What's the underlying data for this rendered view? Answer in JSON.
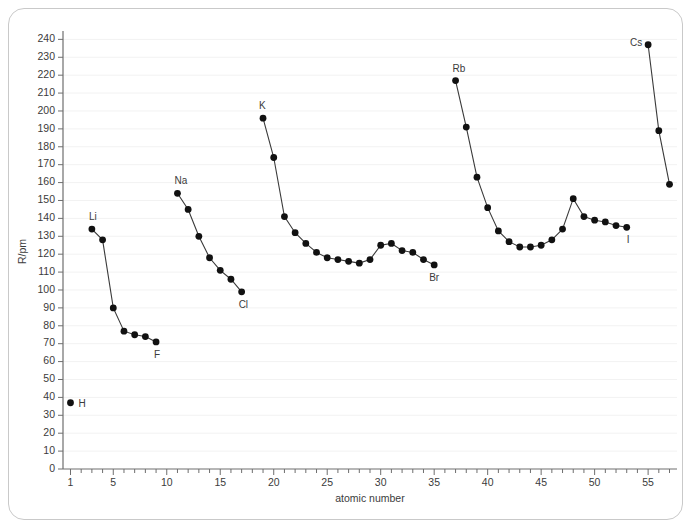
{
  "chart_data": {
    "type": "line",
    "title": "",
    "xlabel": "atomic number",
    "ylabel": "R/pm",
    "xlim": [
      0.3,
      57.7
    ],
    "ylim": [
      0,
      243
    ],
    "grid": true,
    "legend": "none",
    "y_ticks": [
      0,
      10,
      20,
      30,
      40,
      50,
      60,
      70,
      80,
      90,
      100,
      110,
      120,
      130,
      140,
      150,
      160,
      170,
      180,
      190,
      200,
      210,
      220,
      230,
      240
    ],
    "x_ticks_major": [
      1,
      5,
      10,
      15,
      20,
      25,
      30,
      35,
      40,
      45,
      50,
      55
    ],
    "x_tick_step_minor": 1,
    "x_tick_min": 1,
    "x_tick_max": 57,
    "series": [
      {
        "name": "period-1",
        "x": [
          1
        ],
        "values": [
          37
        ]
      },
      {
        "name": "period-2",
        "x": [
          3,
          4,
          5,
          6,
          7,
          8,
          9
        ],
        "values": [
          134,
          128,
          90,
          77,
          75,
          74,
          71
        ]
      },
      {
        "name": "period-3",
        "x": [
          11,
          12,
          13,
          14,
          15,
          16,
          17
        ],
        "values": [
          154,
          145,
          130,
          118,
          111,
          106,
          99
        ]
      },
      {
        "name": "period-4",
        "x": [
          19,
          20,
          21,
          22,
          23,
          24,
          25,
          26,
          27,
          28,
          29,
          30,
          31,
          32,
          33,
          34,
          35
        ],
        "values": [
          196,
          174,
          141,
          132,
          126,
          121,
          118,
          117,
          116,
          115,
          117,
          125,
          126,
          122,
          121,
          117,
          114
        ]
      },
      {
        "name": "period-5",
        "x": [
          37,
          38,
          39,
          40,
          41,
          42,
          43,
          44,
          45,
          46,
          47,
          48,
          49,
          50,
          51,
          52,
          53
        ],
        "values": [
          217,
          191,
          163,
          146,
          133,
          127,
          124,
          124,
          125,
          128,
          134,
          151,
          141,
          139,
          138,
          136,
          135
        ]
      },
      {
        "name": "period-6",
        "x": [
          55,
          56,
          57
        ],
        "values": [
          237,
          189,
          159
        ]
      }
    ],
    "point_labels": [
      {
        "text": "H",
        "x": 1,
        "y": 37,
        "dx": 8,
        "dy": 4
      },
      {
        "text": "Li",
        "x": 3,
        "y": 134,
        "dx": -3,
        "dy": -9
      },
      {
        "text": "F",
        "x": 9,
        "y": 71,
        "dx": -2,
        "dy": 16
      },
      {
        "text": "Na",
        "x": 11,
        "y": 154,
        "dx": -3,
        "dy": -9
      },
      {
        "text": "Cl",
        "x": 17,
        "y": 99,
        "dx": -3,
        "dy": 16
      },
      {
        "text": "K",
        "x": 19,
        "y": 196,
        "dx": -4,
        "dy": -9
      },
      {
        "text": "Br",
        "x": 35,
        "y": 114,
        "dx": -5,
        "dy": 16
      },
      {
        "text": "Rb",
        "x": 37,
        "y": 217,
        "dx": -3,
        "dy": -9
      },
      {
        "text": "I",
        "x": 53,
        "y": 135,
        "dx": 0,
        "dy": 16
      },
      {
        "text": "Cs",
        "x": 55,
        "y": 237,
        "dx": -18,
        "dy": 1
      }
    ],
    "colors": {
      "point": "#111111",
      "line": "#3a3a3a",
      "axis": "#6e6e6e",
      "grid": "#f2f2f2",
      "text": "#3b3b3b",
      "frame": "#c9c9c9",
      "background": "#ffffff"
    }
  }
}
